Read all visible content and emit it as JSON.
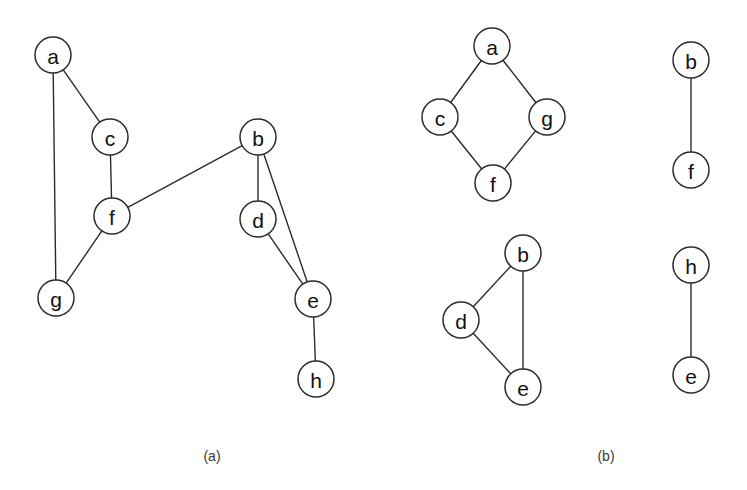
{
  "figure": {
    "background_color": "#ffffff",
    "stroke_color": "#2b2b2b",
    "label_color": "#111111",
    "caption_color": "#3a3a3a",
    "node_radius": 18,
    "node_radius_small": 18
  },
  "panels": [
    {
      "id": "panel-a",
      "caption": "(a)",
      "caption_x": 212,
      "caption_y": 456,
      "description": "Undirected graph with eight vertices",
      "nodes": [
        {
          "id": "a",
          "label": "a",
          "x": 53,
          "y": 55,
          "r": 18
        },
        {
          "id": "c",
          "label": "c",
          "x": 110,
          "y": 137,
          "r": 18
        },
        {
          "id": "f",
          "label": "f",
          "x": 112,
          "y": 216,
          "r": 18
        },
        {
          "id": "g",
          "label": "g",
          "x": 56,
          "y": 298,
          "r": 18
        },
        {
          "id": "b",
          "label": "b",
          "x": 258,
          "y": 137,
          "r": 18
        },
        {
          "id": "d",
          "label": "d",
          "x": 258,
          "y": 219,
          "r": 18
        },
        {
          "id": "e",
          "label": "e",
          "x": 313,
          "y": 299,
          "r": 18
        },
        {
          "id": "h",
          "label": "h",
          "x": 316,
          "y": 379,
          "r": 18
        }
      ],
      "edges": [
        {
          "from": "a",
          "to": "c"
        },
        {
          "from": "a",
          "to": "g"
        },
        {
          "from": "c",
          "to": "f"
        },
        {
          "from": "f",
          "to": "g"
        },
        {
          "from": "f",
          "to": "b"
        },
        {
          "from": "b",
          "to": "d"
        },
        {
          "from": "b",
          "to": "e"
        },
        {
          "from": "d",
          "to": "e"
        },
        {
          "from": "e",
          "to": "h"
        }
      ]
    },
    {
      "id": "panel-b",
      "caption": "(b)",
      "caption_x": 606,
      "caption_y": 456,
      "description": "Four connected components of the graph drawn separately",
      "nodes": [
        {
          "id": "b1_a",
          "label": "a",
          "x": 492,
          "y": 46,
          "r": 18
        },
        {
          "id": "b1_c",
          "label": "c",
          "x": 440,
          "y": 117,
          "r": 18
        },
        {
          "id": "b1_g",
          "label": "g",
          "x": 547,
          "y": 117,
          "r": 18
        },
        {
          "id": "b1_f",
          "label": "f",
          "x": 493,
          "y": 183,
          "r": 18
        },
        {
          "id": "b2_b",
          "label": "b",
          "x": 523,
          "y": 253,
          "r": 18
        },
        {
          "id": "b2_d",
          "label": "d",
          "x": 461,
          "y": 320,
          "r": 18
        },
        {
          "id": "b2_e",
          "label": "e",
          "x": 523,
          "y": 387,
          "r": 18
        },
        {
          "id": "b3_b",
          "label": "b",
          "x": 691,
          "y": 60,
          "r": 18
        },
        {
          "id": "b3_f",
          "label": "f",
          "x": 691,
          "y": 170,
          "r": 18
        },
        {
          "id": "b4_h",
          "label": "h",
          "x": 691,
          "y": 265,
          "r": 18
        },
        {
          "id": "b4_e",
          "label": "e",
          "x": 691,
          "y": 375,
          "r": 18
        }
      ],
      "edges": [
        {
          "from": "b1_a",
          "to": "b1_c"
        },
        {
          "from": "b1_a",
          "to": "b1_g"
        },
        {
          "from": "b1_c",
          "to": "b1_f"
        },
        {
          "from": "b1_g",
          "to": "b1_f"
        },
        {
          "from": "b2_b",
          "to": "b2_d"
        },
        {
          "from": "b2_b",
          "to": "b2_e"
        },
        {
          "from": "b2_d",
          "to": "b2_e"
        },
        {
          "from": "b3_b",
          "to": "b3_f"
        },
        {
          "from": "b4_h",
          "to": "b4_e"
        }
      ]
    }
  ]
}
